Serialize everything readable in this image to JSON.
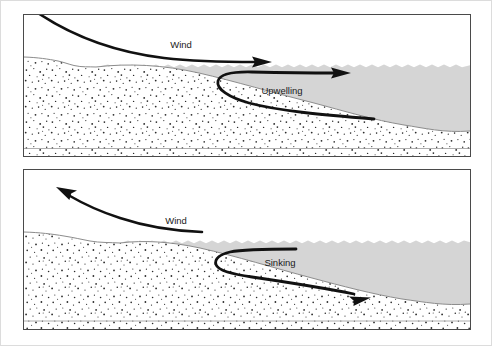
{
  "figure": {
    "background_color": "#ffffff",
    "outer_border_color": "#dcdcdc",
    "panel_border_color": "#4a4a4a",
    "water_color": "#d5d5d5",
    "water_edge_color": "#8c8c8c",
    "seabed_color": "#ffffff",
    "stipple_color": "#2b2b2b",
    "arrow_color": "#111111",
    "label_color": "#1a1a1a"
  },
  "panels": [
    {
      "name": "upwelling-panel",
      "wind_label": "Wind",
      "wind_direction": "offshore-right",
      "current_label": "Upwelling",
      "current_direction": "rising-and-seaward"
    },
    {
      "name": "sinking-panel",
      "wind_label": "Wind",
      "wind_direction": "onshore-left",
      "current_label": "Sinking",
      "current_direction": "descending-and-seaward"
    }
  ],
  "labels": {
    "wind_top": "Wind",
    "upwelling": "Upwelling",
    "wind_bottom": "Wind",
    "sinking": "Sinking"
  }
}
